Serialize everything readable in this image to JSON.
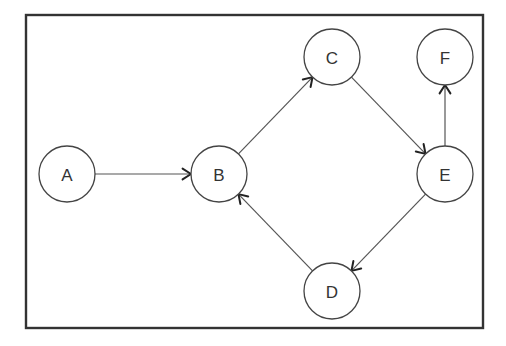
{
  "diagram": {
    "type": "directed-graph",
    "frame": {
      "x": 26,
      "y": 15,
      "width": 457,
      "height": 313,
      "color": "#333333"
    },
    "node_radius": 28,
    "nodes": [
      {
        "id": "A",
        "label": "A",
        "x": 67,
        "y": 174
      },
      {
        "id": "B",
        "label": "B",
        "x": 219,
        "y": 174
      },
      {
        "id": "C",
        "label": "C",
        "x": 332,
        "y": 57
      },
      {
        "id": "F",
        "label": "F",
        "x": 445,
        "y": 57
      },
      {
        "id": "E",
        "label": "E",
        "x": 445,
        "y": 174
      },
      {
        "id": "D",
        "label": "D",
        "x": 332,
        "y": 291
      }
    ],
    "edges": [
      {
        "from": "A",
        "to": "B"
      },
      {
        "from": "B",
        "to": "C"
      },
      {
        "from": "C",
        "to": "E"
      },
      {
        "from": "E",
        "to": "F"
      },
      {
        "from": "E",
        "to": "D"
      },
      {
        "from": "D",
        "to": "B"
      }
    ]
  }
}
